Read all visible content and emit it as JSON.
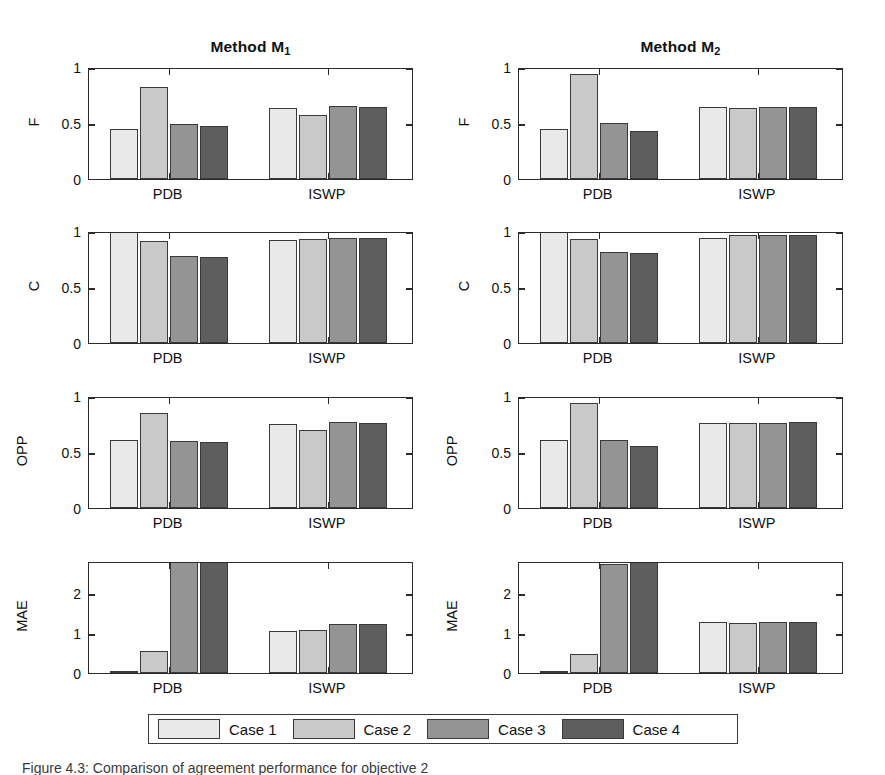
{
  "figure": {
    "background": "#ffffff",
    "caption": "Figure 4.3: Comparison of agreement performance for objective 2"
  },
  "legend": {
    "position": "bottom-center",
    "entries": [
      {
        "label": "Case 1",
        "color": "#e9e9e9"
      },
      {
        "label": "Case 2",
        "color": "#c9c9c9"
      },
      {
        "label": "Case 3",
        "color": "#949494"
      },
      {
        "label": "Case 4",
        "color": "#5e5e5e"
      }
    ]
  },
  "chart_data": {
    "type": "bar",
    "title": "Comparison of agreement performance for objective 2",
    "grid": false,
    "legend_position": "bottom",
    "series_names": [
      "Case 1",
      "Case 2",
      "Case 3",
      "Case 4"
    ],
    "series_colors": [
      "#e9e9e9",
      "#c9c9c9",
      "#949494",
      "#5e5e5e"
    ],
    "categories": [
      "PDB",
      "ISWP"
    ],
    "columns": [
      {
        "title": "Method M",
        "title_sub": "1"
      },
      {
        "title": "Method M",
        "title_sub": "2"
      }
    ],
    "rows": [
      {
        "ylabel": "F",
        "ylim": [
          0,
          1
        ],
        "yticks": [
          0,
          0.5,
          1
        ],
        "ytick_labels": [
          "0",
          "0.5",
          "1"
        ]
      },
      {
        "ylabel": "C",
        "ylim": [
          0,
          1
        ],
        "yticks": [
          0,
          0.5,
          1
        ],
        "ytick_labels": [
          "0",
          "0.5",
          "1"
        ]
      },
      {
        "ylabel": "OPP",
        "ylim": [
          0,
          1
        ],
        "yticks": [
          0,
          0.5,
          1
        ],
        "ytick_labels": [
          "0",
          "0.5",
          "1"
        ]
      },
      {
        "ylabel": "MAE",
        "ylim": [
          0,
          2.8
        ],
        "yticks": [
          0,
          1,
          2
        ],
        "ytick_labels": [
          "0",
          "1",
          "2"
        ]
      }
    ],
    "panels": [
      {
        "row": "F",
        "column": "Method M1",
        "xlabel": "",
        "ylabel": "F",
        "ylim": [
          0,
          1
        ],
        "groups": [
          {
            "category": "PDB",
            "values": [
              0.45,
              0.82,
              0.49,
              0.47
            ]
          },
          {
            "category": "ISWP",
            "values": [
              0.63,
              0.57,
              0.65,
              0.64
            ]
          }
        ]
      },
      {
        "row": "F",
        "column": "Method M2",
        "xlabel": "",
        "ylabel": "F",
        "ylim": [
          0,
          1
        ],
        "groups": [
          {
            "category": "PDB",
            "values": [
              0.45,
              0.94,
              0.5,
              0.43
            ]
          },
          {
            "category": "ISWP",
            "values": [
              0.64,
              0.63,
              0.64,
              0.64
            ]
          }
        ]
      },
      {
        "row": "C",
        "column": "Method M1",
        "xlabel": "",
        "ylabel": "C",
        "ylim": [
          0,
          1
        ],
        "groups": [
          {
            "category": "PDB",
            "values": [
              1.0,
              0.91,
              0.78,
              0.77
            ]
          },
          {
            "category": "ISWP",
            "values": [
              0.92,
              0.93,
              0.94,
              0.94
            ]
          }
        ]
      },
      {
        "row": "C",
        "column": "Method M2",
        "xlabel": "",
        "ylabel": "C",
        "ylim": [
          0,
          1
        ],
        "groups": [
          {
            "category": "PDB",
            "values": [
              1.0,
              0.93,
              0.81,
              0.8
            ]
          },
          {
            "category": "ISWP",
            "values": [
              0.94,
              0.96,
              0.96,
              0.96
            ]
          }
        ]
      },
      {
        "row": "OPP",
        "column": "Method M1",
        "xlabel": "",
        "ylabel": "OPP",
        "ylim": [
          0,
          1
        ],
        "groups": [
          {
            "category": "PDB",
            "values": [
              0.61,
              0.85,
              0.6,
              0.59
            ]
          },
          {
            "category": "ISWP",
            "values": [
              0.75,
              0.7,
              0.77,
              0.76
            ]
          }
        ]
      },
      {
        "row": "OPP",
        "column": "Method M2",
        "xlabel": "",
        "ylabel": "OPP",
        "ylim": [
          0,
          1
        ],
        "groups": [
          {
            "category": "PDB",
            "values": [
              0.61,
              0.94,
              0.61,
              0.55
            ]
          },
          {
            "category": "ISWP",
            "values": [
              0.76,
              0.76,
              0.76,
              0.77
            ]
          }
        ]
      },
      {
        "row": "MAE",
        "column": "Method M1",
        "xlabel": "",
        "ylabel": "MAE",
        "ylim": [
          0,
          2.8
        ],
        "groups": [
          {
            "category": "PDB",
            "values": [
              0.04,
              0.56,
              2.8,
              2.8
            ],
            "clipped": [
              false,
              false,
              true,
              true
            ]
          },
          {
            "category": "ISWP",
            "values": [
              1.05,
              1.08,
              1.23,
              1.22
            ],
            "clipped": [
              false,
              false,
              false,
              false
            ]
          }
        ]
      },
      {
        "row": "MAE",
        "column": "Method M2",
        "xlabel": "",
        "ylabel": "MAE",
        "ylim": [
          0,
          2.8
        ],
        "groups": [
          {
            "category": "PDB",
            "values": [
              0.05,
              0.48,
              2.72,
              2.8
            ],
            "clipped": [
              false,
              false,
              false,
              true
            ]
          },
          {
            "category": "ISWP",
            "values": [
              1.27,
              1.26,
              1.27,
              1.27
            ],
            "clipped": [
              false,
              false,
              false,
              false
            ]
          }
        ]
      }
    ]
  }
}
